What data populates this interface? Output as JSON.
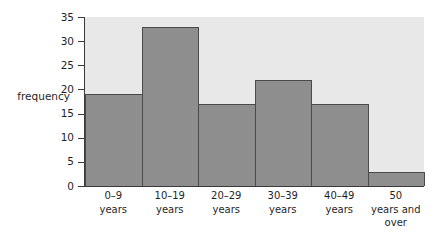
{
  "chart_data": {
    "type": "bar",
    "title": "",
    "subtitle": "",
    "xlabel": "",
    "ylabel": "frequency",
    "categories": [
      "0–9 years",
      "10–19 years",
      "20–29 years",
      "30–39 years",
      "40–49 years",
      "50 years and over"
    ],
    "category_lines": [
      [
        "0–9",
        "years"
      ],
      [
        "10–19",
        "years"
      ],
      [
        "20–29",
        "years"
      ],
      [
        "30–39",
        "years"
      ],
      [
        "40–49",
        "years"
      ],
      [
        "50",
        "years and",
        "over"
      ]
    ],
    "values": [
      19,
      33,
      17,
      22,
      17,
      3
    ],
    "ylim": [
      0,
      35
    ],
    "ytick_values": [
      0,
      5,
      10,
      15,
      20,
      25,
      30,
      35
    ],
    "ytick_labels": [
      "0",
      "5",
      "10",
      "15",
      "20",
      "25",
      "30",
      "35"
    ],
    "grid": false,
    "legend": null,
    "legend_position": "none",
    "bar_fill_color": "#8e8e8e",
    "bar_edge_color": "#4a4a4a",
    "plot_background_color": "#e8e8e8",
    "axis_color": "#3a3a3a",
    "text_color": "#1f1f1f",
    "bar_gap": 0
  }
}
